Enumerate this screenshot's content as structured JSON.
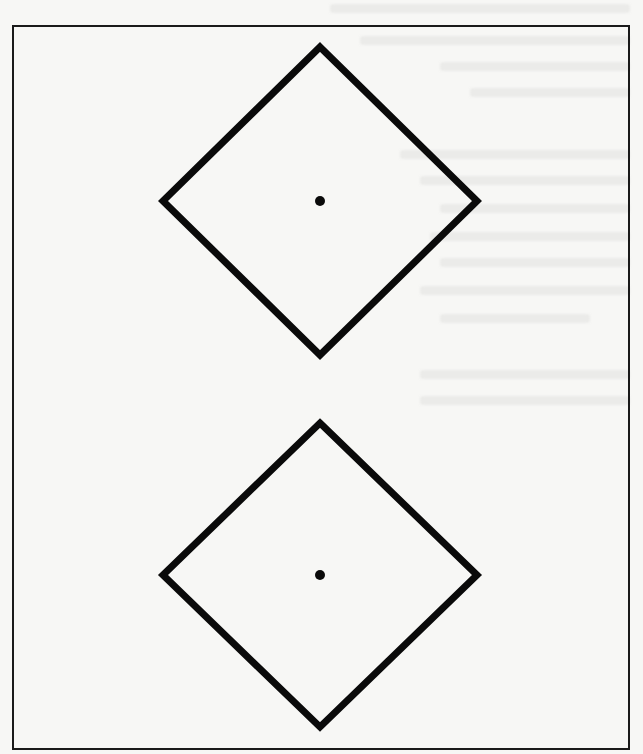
{
  "figure": {
    "frame": {
      "left": 12,
      "top": 25,
      "right": 628,
      "bottom": 748,
      "stroke_width": 2,
      "color": "#1a1a1a"
    },
    "shapes": [
      {
        "type": "diamond",
        "name": "top-diamond",
        "center": [
          320,
          201
        ],
        "half_width": 157,
        "half_height": 154,
        "stroke_width": 7,
        "stroke_color": "#0a0a0a",
        "fill": "none",
        "center_dot": {
          "radius": 5,
          "color": "#0a0a0a"
        }
      },
      {
        "type": "diamond",
        "name": "bottom-diamond",
        "center": [
          320,
          575
        ],
        "half_width": 157,
        "half_height": 152,
        "stroke_width": 7,
        "stroke_color": "#0a0a0a",
        "fill": "none",
        "center_dot": {
          "radius": 5,
          "color": "#0a0a0a"
        }
      }
    ],
    "colors": {
      "paper": "#f7f7f5",
      "ink": "#0a0a0a",
      "bleed_through": "#e2e2e0"
    }
  }
}
